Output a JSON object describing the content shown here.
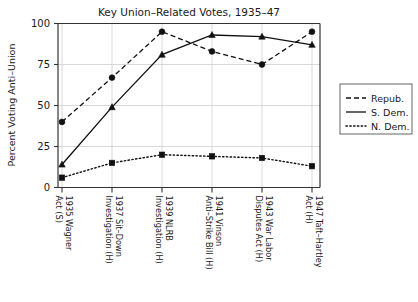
{
  "chart_data": {
    "type": "line",
    "title": "Key Union–Related Votes, 1935–47",
    "xlabel": "",
    "ylabel": "Percent Voting Anti–Union",
    "ylim": [
      0,
      100
    ],
    "yticks": [
      0,
      25,
      50,
      75,
      100
    ],
    "ytick_labels": [
      "0",
      "25",
      "50",
      "75",
      "100"
    ],
    "grid": true,
    "legend_position": "right",
    "categories": [
      "1935 Wagner Act (S)",
      "1937 Sit–Down Investigation (H)",
      "1939 NLRB Investigation (H)",
      "1941 Vinson Anti–Strike Bill (H)",
      "1943 War Labor Disputes Act (H)",
      "1947 Taft–Hartley Act (H)"
    ],
    "series": [
      {
        "name": "Repub.",
        "style": "dashed",
        "marker": "circle",
        "values": [
          40,
          67,
          95,
          83,
          75,
          95
        ]
      },
      {
        "name": "S. Dem.",
        "style": "solid",
        "marker": "triangle",
        "values": [
          14,
          49,
          81,
          93,
          92,
          87
        ]
      },
      {
        "name": "N. Dem.",
        "style": "dotted",
        "marker": "square",
        "values": [
          6,
          15,
          20,
          19,
          18,
          13
        ]
      }
    ]
  },
  "legend": {
    "entries": [
      {
        "label": "Repub.",
        "style": "dashed"
      },
      {
        "label": "S. Dem.",
        "style": "solid"
      },
      {
        "label": "N. Dem.",
        "style": "dotted"
      }
    ]
  }
}
